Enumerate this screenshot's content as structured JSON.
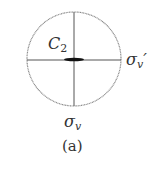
{
  "diagram": {
    "type": "stereographic-projection",
    "caption": "(a)",
    "labels": {
      "rotation_axis": {
        "symbol": "C",
        "subscript": "2"
      },
      "mirror_plane_vertical": {
        "symbol": "σ",
        "subscript": "v"
      },
      "mirror_plane_horizontal": {
        "symbol": "σ",
        "subscript": "v",
        "prime": "′"
      }
    },
    "colors": {
      "circle": "#888888",
      "lines": "#555555",
      "axis_symbol": "#111111",
      "text": "#333333"
    }
  }
}
